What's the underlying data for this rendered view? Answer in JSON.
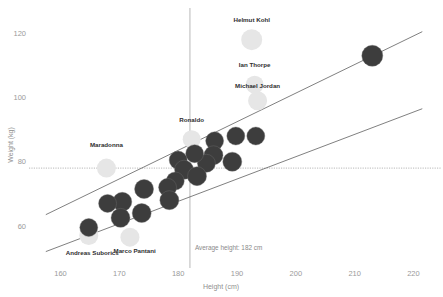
{
  "chart_data": {
    "type": "scatter",
    "title": "",
    "xlabel": "Height (cm)",
    "ylabel": "Weight (kg)",
    "xlim": [
      156,
      224
    ],
    "ylim": [
      50,
      126
    ],
    "xticks": [
      160,
      170,
      180,
      190,
      200,
      210,
      220
    ],
    "yticks": [
      60,
      80,
      100,
      120
    ],
    "grid": false,
    "legend": null,
    "colors": {
      "dark_bubble": "#3d3d3d",
      "light_bubble": "#e6e6e6",
      "trend_line": "#555555",
      "reference_line": "#9a9a9a",
      "axis_text": "#9a9a9a",
      "label_text": "#2e2e2e",
      "background": "#ffffff"
    },
    "reference_lines": {
      "vertical_x": 182,
      "vertical_annotation": "Average height: 182 cm",
      "horizontal_y": 78
    },
    "trend_lines": [
      {
        "name": "upper-trend",
        "x1": 157.5,
        "y1": 63.5,
        "x2": 221.5,
        "y2": 120.5
      },
      {
        "name": "lower-trend",
        "x1": 157.5,
        "y1": 52.0,
        "x2": 221.5,
        "y2": 96.5
      }
    ],
    "points": [
      {
        "label": "Helmut Kohl",
        "x": 192.5,
        "y": 118.0,
        "r": 10.5,
        "style": "light"
      },
      {
        "label": "Ian Thorpe",
        "x": 193.0,
        "y": 104.0,
        "r": 9.0,
        "style": "light"
      },
      {
        "label": "Michael Jordan",
        "x": 193.5,
        "y": 99.0,
        "r": 9.5,
        "style": "light"
      },
      {
        "label": "Maradonna",
        "x": 167.8,
        "y": 78.0,
        "r": 9.5,
        "style": "light"
      },
      {
        "label": "Ronaldo",
        "x": 182.3,
        "y": 87.0,
        "r": 9.0,
        "style": "light"
      },
      {
        "label": "Marco Pantani",
        "x": 171.8,
        "y": 56.5,
        "r": 9.5,
        "style": "light"
      },
      {
        "label": "Andreas Suborics",
        "x": 164.8,
        "y": 57.0,
        "r": 9.5,
        "style": "light"
      },
      {
        "label": "",
        "x": 213.0,
        "y": 113.0,
        "r": 10.5,
        "style": "dark"
      },
      {
        "label": "",
        "x": 193.2,
        "y": 88.0,
        "r": 9.0,
        "style": "dark"
      },
      {
        "label": "",
        "x": 189.8,
        "y": 88.0,
        "r": 9.0,
        "style": "dark"
      },
      {
        "label": "",
        "x": 186.2,
        "y": 86.5,
        "r": 9.0,
        "style": "dark"
      },
      {
        "label": "",
        "x": 189.2,
        "y": 80.0,
        "r": 9.5,
        "style": "dark"
      },
      {
        "label": "",
        "x": 186.0,
        "y": 82.0,
        "r": 9.5,
        "style": "dark"
      },
      {
        "label": "",
        "x": 184.8,
        "y": 79.5,
        "r": 9.0,
        "style": "dark"
      },
      {
        "label": "",
        "x": 182.8,
        "y": 82.5,
        "r": 9.0,
        "style": "dark"
      },
      {
        "label": "",
        "x": 180.0,
        "y": 80.5,
        "r": 9.0,
        "style": "dark"
      },
      {
        "label": "",
        "x": 181.0,
        "y": 77.5,
        "r": 9.5,
        "style": "dark"
      },
      {
        "label": "",
        "x": 183.2,
        "y": 75.5,
        "r": 9.5,
        "style": "dark"
      },
      {
        "label": "",
        "x": 179.5,
        "y": 74.0,
        "r": 9.0,
        "style": "dark"
      },
      {
        "label": "",
        "x": 178.2,
        "y": 72.0,
        "r": 9.0,
        "style": "dark"
      },
      {
        "label": "",
        "x": 178.5,
        "y": 68.0,
        "r": 9.5,
        "style": "dark"
      },
      {
        "label": "",
        "x": 174.2,
        "y": 71.5,
        "r": 9.5,
        "style": "dark"
      },
      {
        "label": "",
        "x": 173.8,
        "y": 64.0,
        "r": 9.5,
        "style": "dark"
      },
      {
        "label": "",
        "x": 170.5,
        "y": 67.5,
        "r": 9.5,
        "style": "dark"
      },
      {
        "label": "",
        "x": 170.2,
        "y": 62.5,
        "r": 9.5,
        "style": "dark"
      },
      {
        "label": "",
        "x": 168.0,
        "y": 67.0,
        "r": 9.0,
        "style": "dark"
      },
      {
        "label": "",
        "x": 164.8,
        "y": 59.5,
        "r": 9.0,
        "style": "dark"
      }
    ],
    "point_labels": [
      {
        "text": "Helmut Kohl",
        "x": 192.5,
        "y": 123.5,
        "anchor": "middle"
      },
      {
        "text": "Ian Thorpe",
        "x": 193.0,
        "y": 109.5,
        "anchor": "middle"
      },
      {
        "text": "Michael Jordan",
        "x": 193.5,
        "y": 103.0,
        "anchor": "middle"
      },
      {
        "text": "Maradonna",
        "x": 167.8,
        "y": 84.5,
        "anchor": "middle"
      },
      {
        "text": "Ronaldo",
        "x": 182.3,
        "y": 92.5,
        "anchor": "middle"
      },
      {
        "text": "Marco Pantani",
        "x": 172.6,
        "y": 51.5,
        "anchor": "middle"
      },
      {
        "text": "Andreas Suborics",
        "x": 165.4,
        "y": 51.0,
        "anchor": "middle"
      }
    ]
  }
}
